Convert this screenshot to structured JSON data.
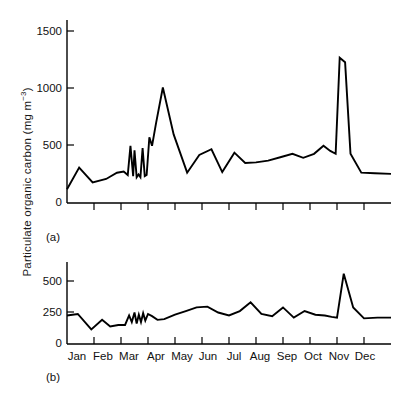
{
  "figure": {
    "y_axis_label_main": "Particulate organic carbon (mg m",
    "y_axis_label_exponent": "−3",
    "y_axis_label_close": ")",
    "panel_a_label": "(a)",
    "panel_b_label": "(b)"
  },
  "chart_data": [
    {
      "type": "line",
      "panel": "(a)",
      "title": "",
      "xlabel": "",
      "ylabel": "Particulate organic carbon (mg m−3)",
      "ylim": [
        0,
        1600
      ],
      "yticks": [
        0,
        500,
        1000,
        1500
      ],
      "ytick_labels": [
        "0",
        "500",
        "1000",
        "1500"
      ],
      "xlim": [
        0,
        12
      ],
      "xticks": [
        0,
        1,
        2,
        3,
        4,
        5,
        6,
        7,
        8,
        9,
        10,
        11,
        12
      ],
      "xtick_labels": [
        "",
        "",
        "",
        "",
        "",
        "",
        "",
        "",
        "",
        "",
        "",
        "",
        ""
      ],
      "grid": false,
      "legend": "none",
      "line_color": "#000000",
      "categories": [
        "Jan",
        "Feb",
        "Mar",
        "Apr",
        "May",
        "Jun",
        "Jul",
        "Aug",
        "Sep",
        "Oct",
        "Nov",
        "Dec"
      ],
      "x": [
        0.0,
        0.45,
        0.95,
        1.45,
        1.85,
        2.1,
        2.25,
        2.35,
        2.45,
        2.5,
        2.58,
        2.65,
        2.72,
        2.8,
        2.88,
        2.95,
        3.05,
        3.15,
        3.3,
        3.55,
        3.95,
        4.45,
        4.9,
        5.35,
        5.75,
        6.2,
        6.6,
        7.0,
        7.45,
        7.9,
        8.35,
        8.75,
        9.15,
        9.5,
        9.75,
        9.95,
        10.1,
        10.3,
        10.5,
        10.9,
        11.4,
        12.0
      ],
      "values": [
        120,
        310,
        180,
        210,
        265,
        275,
        245,
        500,
        235,
        460,
        225,
        250,
        225,
        480,
        235,
        245,
        575,
        500,
        700,
        1010,
        600,
        265,
        420,
        470,
        270,
        440,
        350,
        355,
        370,
        400,
        430,
        395,
        430,
        500,
        455,
        430,
        1270,
        1230,
        430,
        265,
        260,
        255
      ]
    },
    {
      "type": "line",
      "panel": "(b)",
      "title": "",
      "xlabel": "",
      "ylabel": "Particulate organic carbon (mg m−3)",
      "ylim": [
        0,
        560
      ],
      "yticks": [
        0,
        250,
        500
      ],
      "ytick_labels": [
        "0",
        "250",
        "500"
      ],
      "xlim": [
        0,
        12
      ],
      "xticks": [
        0,
        1,
        2,
        3,
        4,
        5,
        6,
        7,
        8,
        9,
        10,
        11,
        12
      ],
      "xtick_labels": [
        "Jan",
        "Feb",
        "Mar",
        "Apr",
        "May",
        "Jun",
        "Jul",
        "Aug",
        "Sep",
        "Oct",
        "Nov",
        "Dec"
      ],
      "grid": false,
      "legend": "none",
      "line_color": "#000000",
      "categories": [
        "Jan",
        "Feb",
        "Mar",
        "Apr",
        "May",
        "Jun",
        "Jul",
        "Aug",
        "Sep",
        "Oct",
        "Nov",
        "Dec"
      ],
      "x": [
        0.0,
        0.4,
        0.9,
        1.3,
        1.6,
        1.9,
        2.15,
        2.3,
        2.4,
        2.5,
        2.58,
        2.66,
        2.74,
        2.82,
        2.9,
        3.0,
        3.15,
        3.35,
        3.6,
        4.0,
        4.4,
        4.8,
        5.2,
        5.6,
        6.0,
        6.4,
        6.8,
        7.2,
        7.6,
        8.0,
        8.4,
        8.8,
        9.2,
        9.55,
        9.8,
        10.0,
        10.25,
        10.6,
        11.0,
        11.5,
        12.0
      ],
      "values": [
        195,
        205,
        100,
        165,
        120,
        130,
        130,
        195,
        150,
        215,
        140,
        200,
        150,
        210,
        160,
        205,
        190,
        165,
        170,
        200,
        225,
        250,
        255,
        215,
        195,
        225,
        285,
        205,
        190,
        250,
        180,
        225,
        200,
        195,
        185,
        180,
        480,
        250,
        175,
        180,
        180
      ]
    }
  ],
  "axes": {
    "panel_a": {
      "ytick_labels": [
        "1500",
        "1000",
        "500",
        "0"
      ]
    },
    "panel_b": {
      "ytick_labels": [
        "500",
        "250",
        "0"
      ]
    },
    "months": [
      "Jan",
      "Feb",
      "Mar",
      "Apr",
      "May",
      "Jun",
      "Jul",
      "Aug",
      "Sep",
      "Oct",
      "Nov",
      "Dec"
    ]
  }
}
